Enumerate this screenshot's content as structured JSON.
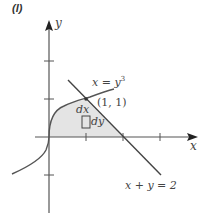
{
  "panel_label": "(l)",
  "axes": {
    "x_label": "x",
    "y_label": "y",
    "origin_px": [
      49,
      137
    ],
    "unit_px": 37,
    "x_ticks": [
      1,
      2,
      3
    ],
    "y_ticks": [
      -1,
      1,
      2
    ]
  },
  "curves": {
    "cubic_label": "x = y",
    "cubic_exponent": "3",
    "line_label": "x + y = 2"
  },
  "point_label": "(1, 1)",
  "element_labels": {
    "dx": "dx",
    "dy": "dy"
  },
  "colors": {
    "axis": "#555555",
    "curve": "#555555",
    "shade": "#e4e4e4",
    "text": "#444444"
  }
}
